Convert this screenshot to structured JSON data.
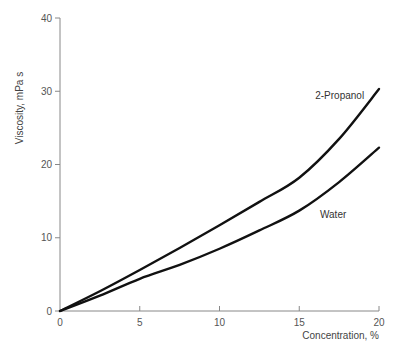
{
  "chart_data": {
    "type": "line",
    "title": "",
    "xlabel": "Concentration, %",
    "ylabel": "Viscosity, mPa s",
    "xlim": [
      0,
      20
    ],
    "ylim": [
      0,
      40
    ],
    "xticks": [
      0,
      5,
      10,
      15,
      20
    ],
    "yticks": [
      0,
      10,
      20,
      30,
      40
    ],
    "grid": false,
    "legend": "inline labels",
    "x": [
      0,
      2.5,
      5,
      7.5,
      10,
      12.5,
      15,
      17.5,
      20
    ],
    "series": [
      {
        "name": "2-Propanol",
        "values": [
          0,
          2.7,
          5.6,
          8.6,
          11.7,
          14.9,
          18.2,
          23.5,
          30.3
        ],
        "label_pos": {
          "x": 16.0,
          "y": 29.0
        }
      },
      {
        "name": "Water",
        "values": [
          0,
          2.1,
          4.4,
          6.3,
          8.5,
          11.0,
          13.7,
          17.6,
          22.3
        ],
        "label_pos": {
          "x": 16.3,
          "y": 12.7
        }
      }
    ]
  }
}
